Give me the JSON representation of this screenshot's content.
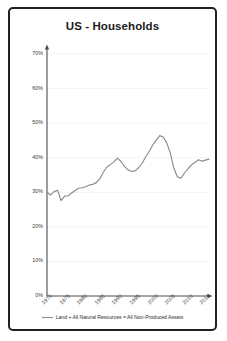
{
  "card": {
    "border_color": "#231f20",
    "background": "#ffffff"
  },
  "chart_data": {
    "type": "line",
    "title": "US - Households",
    "xlabel": "",
    "ylabel": "",
    "grid": true,
    "legend_position": "bottom",
    "line_color": "#8a8a8a",
    "axis_color": "#4d4d4d",
    "ylim": [
      0,
      70
    ],
    "yticks": [
      "0%",
      "10%",
      "20%",
      "30%",
      "40%",
      "50%",
      "60%",
      "70%"
    ],
    "ytick_values": [
      0,
      10,
      20,
      30,
      40,
      50,
      60,
      70
    ],
    "xlim": [
      1970,
      2016
    ],
    "xticks": [
      "1970",
      "1975",
      "1980",
      "1985",
      "1990",
      "1995",
      "2000",
      "2005",
      "2010",
      "2015"
    ],
    "xtick_values": [
      1970,
      1975,
      1980,
      1985,
      1990,
      1995,
      2000,
      2005,
      2010,
      2015
    ],
    "series": [
      {
        "name": "Land + All Natural Resources = All Non-Produced Assets",
        "x": [
          1970,
          1971,
          1972,
          1973,
          1974,
          1975,
          1976,
          1977,
          1978,
          1979,
          1980,
          1981,
          1982,
          1983,
          1984,
          1985,
          1986,
          1987,
          1988,
          1989,
          1990,
          1991,
          1992,
          1993,
          1994,
          1995,
          1996,
          1997,
          1998,
          1999,
          2000,
          2001,
          2002,
          2003,
          2004,
          2005,
          2006,
          2007,
          2008,
          2009,
          2010,
          2011,
          2012,
          2013,
          2014,
          2015,
          2016
        ],
        "values": [
          30.0,
          29.2,
          30.2,
          30.6,
          27.6,
          28.9,
          29.0,
          29.8,
          30.5,
          31.2,
          31.3,
          31.6,
          32.1,
          32.3,
          32.8,
          33.9,
          35.8,
          37.3,
          38.0,
          38.8,
          39.9,
          38.9,
          37.5,
          36.5,
          36.0,
          36.2,
          37.1,
          38.4,
          40.2,
          41.8,
          43.6,
          45.0,
          46.4,
          46.0,
          44.3,
          41.4,
          37.0,
          34.5,
          34.1,
          35.5,
          36.8,
          37.9,
          38.6,
          39.4,
          39.0,
          39.3,
          39.6
        ]
      }
    ]
  },
  "legend": {
    "label": "Land + All Natural Resources = All Non-Produced Assets"
  }
}
